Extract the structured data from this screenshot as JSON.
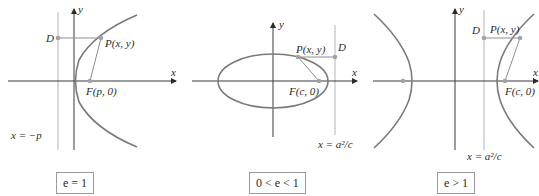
{
  "panels": [
    {
      "id": "parabola",
      "caption": "e = 1",
      "axis_labels": {
        "x": "x",
        "y": "y"
      },
      "point_P": "P(x, y)",
      "point_D": "D",
      "focus": "F(p, 0)",
      "directrix": "x = −p"
    },
    {
      "id": "ellipse",
      "caption": "0 < e < 1",
      "axis_labels": {
        "x": "x",
        "y": "y"
      },
      "point_P": "P(x, y)",
      "point_D": "D",
      "focus": "F(c, 0)",
      "directrix": "x = a²/c"
    },
    {
      "id": "hyperbola",
      "caption": "e > 1",
      "axis_labels": {
        "x": "x",
        "y": "y"
      },
      "point_P": "P(x, y)",
      "point_D": "D",
      "focus": "F(c, 0)",
      "directrix": "x = a²/c"
    }
  ],
  "colors": {
    "curve": "#7a7a7a",
    "axis": "#3a3a3a",
    "directrix": "#b5b5b5",
    "point": "#a3a3a3"
  }
}
